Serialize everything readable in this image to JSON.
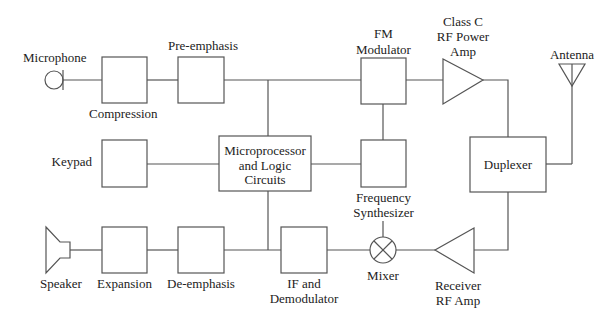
{
  "diagram": {
    "type": "block-diagram",
    "blocks": {
      "microphone": {
        "label": "Microphone"
      },
      "compression": {
        "label": "Compression"
      },
      "pre_emphasis": {
        "label": "Pre-emphasis"
      },
      "fm_modulator": {
        "label_line1": "FM",
        "label_line2": "Modulator"
      },
      "class_c_amp": {
        "label_line1": "Class C",
        "label_line2": "RF Power",
        "label_line3": "Amp"
      },
      "antenna": {
        "label": "Antenna"
      },
      "keypad": {
        "label": "Keypad"
      },
      "microprocessor": {
        "label_line1": "Microprocessor",
        "label_line2": "and Logic",
        "label_line3": "Circuits"
      },
      "frequency_synthesizer": {
        "label_line1": "Frequency",
        "label_line2": "Synthesizer"
      },
      "duplexer": {
        "label": "Duplexer"
      },
      "speaker": {
        "label": "Speaker"
      },
      "expansion": {
        "label": "Expansion"
      },
      "de_emphasis": {
        "label": "De-emphasis"
      },
      "if_demodulator": {
        "label_line1": "IF and",
        "label_line2": "Demodulator"
      },
      "mixer": {
        "label": "Mixer"
      },
      "receiver_amp": {
        "label_line1": "Receiver",
        "label_line2": "RF Amp"
      }
    },
    "connections": [
      [
        "Microphone",
        "Compression"
      ],
      [
        "Compression",
        "Pre-emphasis"
      ],
      [
        "Pre-emphasis",
        "FM Modulator"
      ],
      [
        "Pre-emphasis/FM line",
        "Microprocessor and Logic Circuits"
      ],
      [
        "FM Modulator",
        "Class C RF Power Amp"
      ],
      [
        "Class C RF Power Amp",
        "Duplexer"
      ],
      [
        "Duplexer",
        "Antenna"
      ],
      [
        "Keypad",
        "Microprocessor and Logic Circuits"
      ],
      [
        "Microprocessor and Logic Circuits",
        "Frequency Synthesizer"
      ],
      [
        "Frequency Synthesizer",
        "FM Modulator"
      ],
      [
        "Frequency Synthesizer",
        "Mixer"
      ],
      [
        "Duplexer",
        "Receiver RF Amp"
      ],
      [
        "Receiver RF Amp",
        "Mixer"
      ],
      [
        "Mixer",
        "IF and Demodulator"
      ],
      [
        "IF and Demodulator",
        "De-emphasis"
      ],
      [
        "IF/De-emphasis line",
        "Microprocessor and Logic Circuits"
      ],
      [
        "De-emphasis",
        "Expansion"
      ],
      [
        "Expansion",
        "Speaker"
      ]
    ]
  }
}
